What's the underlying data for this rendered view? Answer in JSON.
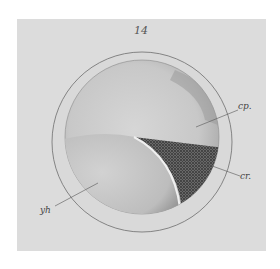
{
  "figure": {
    "number": "14",
    "labels": {
      "cp": "cp.",
      "cr": "cr.",
      "yh": "yh"
    }
  },
  "colors": {
    "plate_background": "#dcdcdc",
    "outer_ring_fill": "#d8d8d8",
    "inner_sphere_fill": "#c9c9c9",
    "stippled_region": "#4a4a4a",
    "line": "#555555"
  }
}
